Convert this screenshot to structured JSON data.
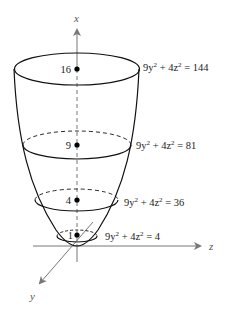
{
  "figure": {
    "type": "elliptic-paraboloid",
    "equation_family": "9y^2 + 4z^2 = 9x",
    "axes": {
      "x": {
        "label": "x"
      },
      "y": {
        "label": "y"
      },
      "z": {
        "label": "z"
      }
    },
    "levels": [
      {
        "x_value": "16",
        "trace_base": "9y",
        "trace_mid": " + 4z",
        "trace_rhs": " = 144"
      },
      {
        "x_value": "9",
        "trace_base": "9y",
        "trace_mid": " + 4z",
        "trace_rhs": " = 81"
      },
      {
        "x_value": "4",
        "trace_base": "9y",
        "trace_mid": " + 4z",
        "trace_rhs": " = 36"
      },
      {
        "x_value": "1",
        "trace_base": "9y",
        "trace_mid": " + 4z",
        "trace_rhs": " = 4"
      }
    ],
    "exponent": "2",
    "colors": {
      "curve": "#111111",
      "axis": "#777777",
      "text": "#222222"
    }
  }
}
